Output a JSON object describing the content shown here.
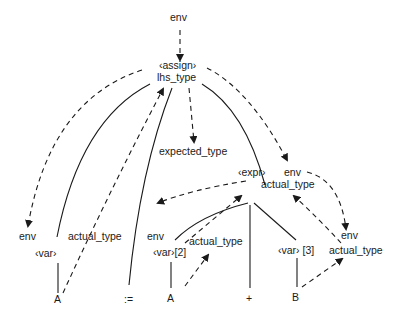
{
  "diagram": {
    "type": "attributed-parse-tree",
    "labels": {
      "root_env": "env",
      "assign": "‹assign›",
      "lhs_type": "lhs_type",
      "expected_type": "expected_type",
      "expr": "‹expr›",
      "expr_env": "env",
      "expr_actual_type": "actual_type",
      "var1_env": "env",
      "var1": "‹var›",
      "var1_actual_type": "actual_type",
      "leaf_A1": "A",
      "leaf_assign_op": ":=",
      "var2_env": "env",
      "var2": "‹var›[2]",
      "var2_actual_type": "actual_type",
      "leaf_A2": "A",
      "leaf_plus": "+",
      "var3": "‹var› [3]",
      "var3_env": "env",
      "var3_actual_type": "actual_type",
      "leaf_B": "B"
    }
  }
}
